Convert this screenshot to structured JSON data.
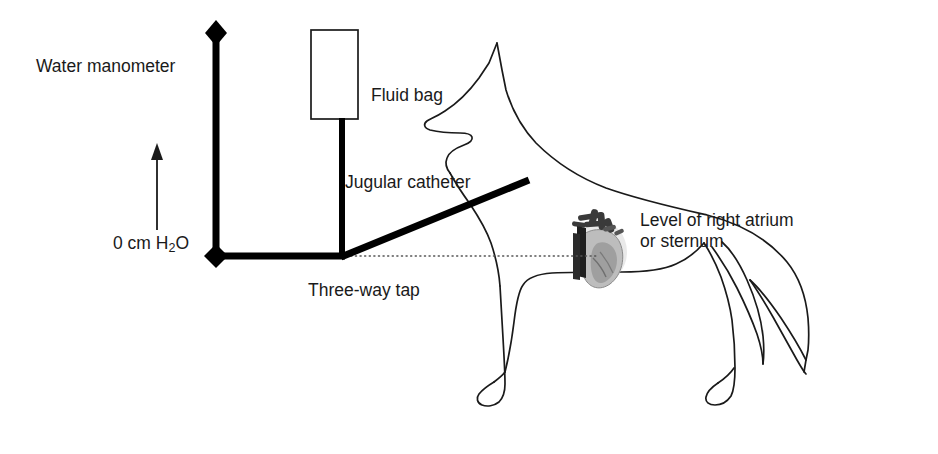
{
  "figure": {
    "background_color": "#ffffff",
    "line_color": "#000000",
    "text_color": "#1a1a1a",
    "width": 938,
    "height": 454
  },
  "labels": {
    "water_manometer": "Water manometer",
    "fluid_bag": "Fluid bag",
    "jugular_catheter": "Jugular catheter",
    "zero_reference": "0 cm H",
    "zero_reference_subscript": "2",
    "zero_reference_tail": "O",
    "three_way_tap": "Three-way tap",
    "level_line1": "Level of right atrium",
    "level_line2": "or sternum"
  },
  "components": {
    "manometer": {
      "name": "water-manometer-column",
      "top_marker": "diamond",
      "bottom_marker": "diamond",
      "orientation": "vertical"
    },
    "fluid_bag": {
      "name": "fluid-bag",
      "shape": "rectangle",
      "fill": "#ffffff",
      "stroke": "#000000"
    },
    "three_way_tap": {
      "name": "three-way-tap-junction",
      "ports": 3
    },
    "catheter": {
      "name": "jugular-catheter-line",
      "orientation": "diagonal"
    },
    "reference_line": {
      "name": "atrium-level-dotted-line",
      "style": "dotted"
    },
    "heart": {
      "name": "heart-illustration",
      "rendering": "grayscale"
    },
    "dog": {
      "name": "dog-silhouette",
      "rendering": "outline"
    }
  },
  "arrow": {
    "name": "pressure-height-arrow",
    "direction": "up"
  }
}
